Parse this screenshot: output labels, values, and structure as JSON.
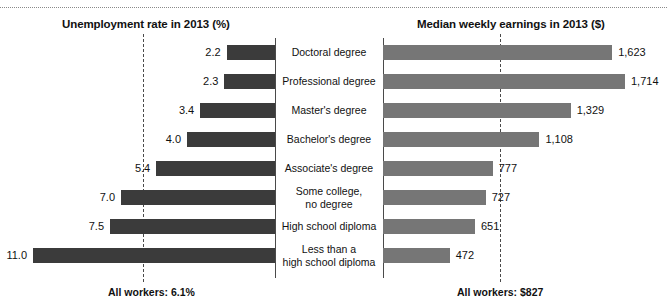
{
  "figure": {
    "left_panel_title": "Unemployment rate in 2013 (%)",
    "right_panel_title": "Median weekly earnings in 2013 ($)",
    "left_footnote": "All workers: 6.1%",
    "right_footnote": "All workers: $827",
    "left_bar_color": "#3b3b3b",
    "right_bar_color": "#767676",
    "axis_color": "#4a4a4a",
    "background": "#ffffff"
  },
  "chart_data": {
    "type": "bar",
    "orientation": "horizontal",
    "layout": "diverging back-to-back panels sharing centered category labels",
    "categories": [
      "Doctoral degree",
      "Professional degree",
      "Master's degree",
      "Bachelor's degree",
      "Associate's degree",
      "Some college,\nno degree",
      "High school diploma",
      "Less than a\nhigh school diploma"
    ],
    "series": [
      {
        "name": "Unemployment rate in 2013 (%)",
        "panel": "left",
        "direction": "right-to-left",
        "unit": "%",
        "xlabel": "Unemployment rate in 2013 (%)",
        "xlim": [
          0,
          11.0
        ],
        "values": [
          2.2,
          2.3,
          3.4,
          4.0,
          5.4,
          7.0,
          7.5,
          11.0
        ],
        "labels": [
          "2.2",
          "2.3",
          "3.4",
          "4.0",
          "5.4",
          "7.0",
          "7.5",
          "11.0"
        ],
        "reference_line": {
          "label": "All workers: 6.1%",
          "value": 6.1,
          "style": "dashed"
        }
      },
      {
        "name": "Median weekly earnings in 2013 ($)",
        "panel": "right",
        "direction": "left-to-right",
        "unit": "$",
        "xlabel": "Median weekly earnings in 2013 ($)",
        "xlim": [
          0,
          1714
        ],
        "values": [
          1623,
          1714,
          1329,
          1108,
          777,
          727,
          651,
          472
        ],
        "labels": [
          "1,623",
          "1,714",
          "1,329",
          "1,108",
          "777",
          "727",
          "651",
          "472"
        ],
        "reference_line": {
          "label": "All workers: $827",
          "value": 827,
          "style": "dashed"
        }
      }
    ],
    "grid": false,
    "legend": "none",
    "tick_labels": "none (values annotated at bar ends)"
  }
}
